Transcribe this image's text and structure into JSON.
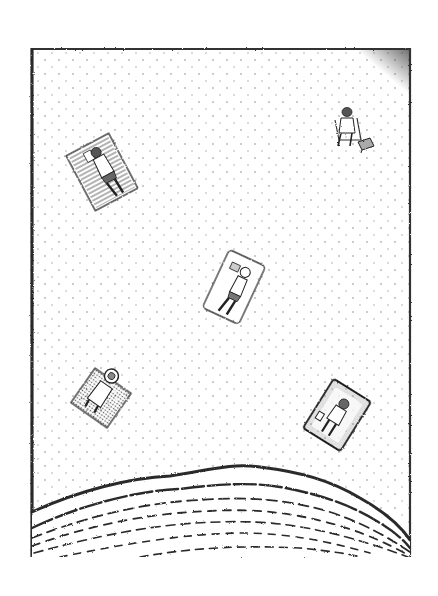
{
  "illustration": {
    "subject": "Aerial view of a sandy beach with sunbathers, drawn in pen-and-ink stipple",
    "style": "black ink stippling on white paper",
    "colors": {
      "paper": "#ffffff",
      "ink": "#2a2a2a",
      "sand_dot": "#8a8a8a",
      "shade": "#555555"
    },
    "frame": {
      "x": 30,
      "y": 48,
      "width": 381,
      "height": 509
    },
    "figures": [
      {
        "id": "towel-reader-top-left",
        "description": "Person lying face-down reading on a striped towel",
        "cx": 102,
        "cy": 172,
        "w": 48,
        "h": 62,
        "angle": -28,
        "towel_pattern": "stripes"
      },
      {
        "id": "seated-person-top-right",
        "description": "Person sitting in a beach chair with a small bag beside",
        "cx": 350,
        "cy": 128
      },
      {
        "id": "towel-reader-center",
        "description": "Person lying on back reading a book on a white towel",
        "cx": 234,
        "cy": 287,
        "w": 40,
        "h": 64,
        "angle": 25,
        "towel_pattern": "plain"
      },
      {
        "id": "towel-hat-bottom-left",
        "description": "Person with sun hat lying on a dotted towel",
        "cx": 101,
        "cy": 398,
        "w": 44,
        "h": 42,
        "angle": 35,
        "towel_pattern": "dots"
      },
      {
        "id": "towel-person-bottom-right",
        "description": "Person lying on a shaded towel with a small item",
        "cx": 337,
        "cy": 415,
        "w": 44,
        "h": 58,
        "angle": 32,
        "towel_pattern": "shaded"
      }
    ],
    "sea": {
      "description": "Water with wavy shoreline lines at the bottom",
      "shoreline_peak_y": 466,
      "wave_line_count": 7
    }
  }
}
